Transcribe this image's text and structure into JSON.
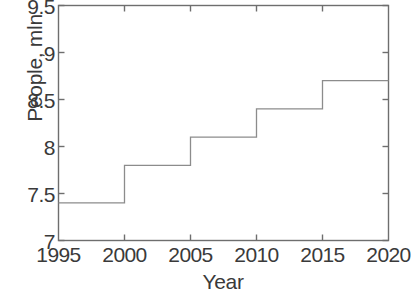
{
  "chart_data": {
    "type": "line",
    "subtype": "step",
    "title": "",
    "xlabel": "Year",
    "ylabel": "People, mln",
    "xlim": [
      1995,
      2020
    ],
    "ylim": [
      7,
      9.5
    ],
    "xticks": [
      1995,
      2000,
      2005,
      2010,
      2015,
      2020
    ],
    "xtick_labels": [
      "1995",
      "2000",
      "2005",
      "2010",
      "2015",
      "2020"
    ],
    "yticks": [
      7,
      7.5,
      8,
      8.5,
      9,
      9.5
    ],
    "ytick_labels": [
      "7",
      "7.5",
      "8",
      "8.5",
      "9",
      "9.5"
    ],
    "grid": false,
    "legend": false,
    "tick_direction": "in",
    "box": true,
    "line_color": "#8c8c8c",
    "axis_color": "#6e6e6e",
    "text_color": "#3a3a3a",
    "background": "#ffffff",
    "series": [
      {
        "name": "People, mln",
        "x": [
          1995,
          2000,
          2005,
          2010,
          2015,
          2020
        ],
        "values": [
          7.4,
          7.8,
          8.1,
          8.4,
          8.7,
          8.7
        ],
        "steps": [
          {
            "x_start": 1995,
            "x_end": 2000,
            "y": 7.4
          },
          {
            "x_start": 2000,
            "x_end": 2005,
            "y": 7.8
          },
          {
            "x_start": 2005,
            "x_end": 2010,
            "y": 8.1
          },
          {
            "x_start": 2010,
            "x_end": 2015,
            "y": 8.4
          },
          {
            "x_start": 2015,
            "x_end": 2020,
            "y": 8.7
          }
        ]
      }
    ]
  }
}
